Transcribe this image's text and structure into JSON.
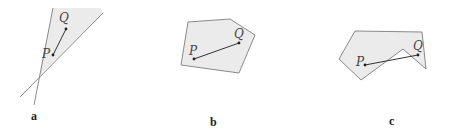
{
  "figures": [
    {
      "id": "a",
      "label": "a",
      "description": "Convex region between two intersecting lines (wedge)",
      "point_labels": {
        "P": "P",
        "Q": "Q"
      }
    },
    {
      "id": "b",
      "label": "b",
      "description": "Convex polygon with segment PQ inside",
      "point_labels": {
        "P": "P",
        "Q": "Q"
      }
    },
    {
      "id": "c",
      "label": "c",
      "description": "Non-convex polygon; segment PQ leaves the region",
      "point_labels": {
        "P": "P",
        "Q": "Q"
      }
    }
  ],
  "colors": {
    "fill": "#ebebeb",
    "stroke": "#8a8a8a",
    "segment": "#333333"
  }
}
